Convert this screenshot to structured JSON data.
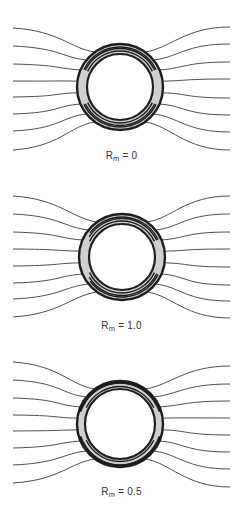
{
  "figure": {
    "panels": [
      {
        "id": "rm-0",
        "label_symbol": "R",
        "label_subscript": "m",
        "label_value": " = 0",
        "top": 0,
        "center": [
          120,
          87
        ],
        "outer_radius": 43,
        "inner_radius": 33,
        "shading": "symmetric",
        "field_lines_left_y": [
          28,
          46,
          64,
          81,
          97,
          114,
          131,
          150
        ],
        "field_lines_right_y": [
          27,
          44,
          62,
          79,
          98,
          115,
          132,
          150
        ]
      },
      {
        "id": "rm-1.0",
        "label_symbol": "R",
        "label_subscript": "m",
        "label_value": " = 1.0",
        "top": 170,
        "center": [
          122,
          87
        ],
        "outer_radius": 43,
        "inner_radius": 33,
        "shading": "skewed",
        "field_lines_left_y": [
          26,
          44,
          62,
          79,
          96,
          113,
          129,
          147
        ],
        "field_lines_right_y": [
          26,
          44,
          62,
          79,
          97,
          115,
          131,
          148
        ]
      },
      {
        "id": "rm-0.5",
        "label_symbol": "R",
        "label_subscript": "m",
        "label_value": " = 0.5",
        "top": 338,
        "center": [
          120,
          86
        ],
        "outer_radius": 43,
        "inner_radius": 35,
        "shading": "thin-shells",
        "field_lines_left_y": [
          24,
          42,
          60,
          77,
          93,
          110,
          127,
          145
        ],
        "field_lines_right_y": [
          28,
          46,
          63,
          80,
          97,
          114,
          131,
          149
        ]
      }
    ],
    "colors": {
      "line": "#3a3a3a",
      "ring_dark": "#1e1e1e",
      "ring_fill": "#cfcfcf",
      "background": "#ffffff"
    }
  }
}
